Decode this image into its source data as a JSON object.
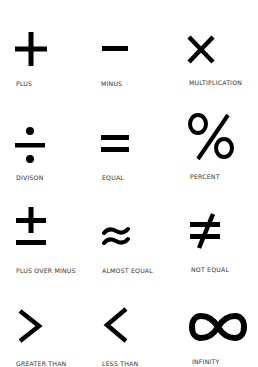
{
  "symbols": [
    {
      "name": "plus",
      "label": "PLUS"
    },
    {
      "name": "minus",
      "label": "MINUS"
    },
    {
      "name": "multiplication",
      "label": "MULTIPLICATION"
    },
    {
      "name": "division",
      "label": "DIVISON"
    },
    {
      "name": "equal",
      "label": "EQUAL"
    },
    {
      "name": "percent",
      "label": "PERCENT",
      "glyph": "%"
    },
    {
      "name": "plus-over-minus",
      "label": "PLUS OVER MINUS"
    },
    {
      "name": "almost-equal",
      "label": "ALMOST EQUAL"
    },
    {
      "name": "not-equal",
      "label": "NOT EQUAL"
    },
    {
      "name": "greater-than",
      "label": "GREATER THAN"
    },
    {
      "name": "less-than",
      "label": "LESS THAN"
    },
    {
      "name": "infinity",
      "label": "INFINITY"
    }
  ],
  "colors": {
    "symbol": "#000000",
    "label": "#333333",
    "background": "#ffffff"
  }
}
